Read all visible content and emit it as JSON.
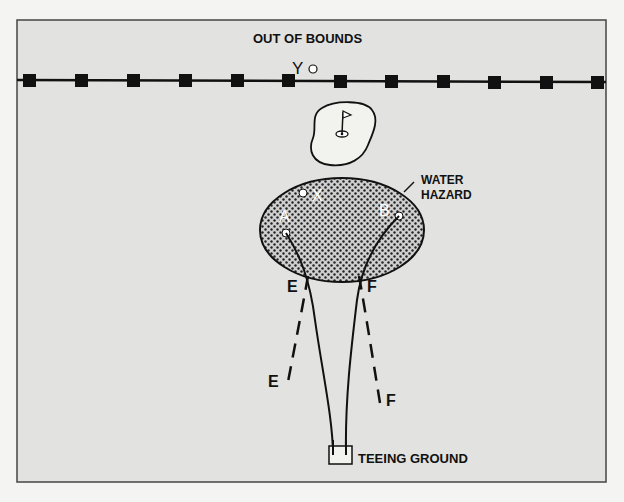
{
  "diagram": {
    "labels": {
      "out_of_bounds": "OUT OF BOUNDS",
      "water_hazard_line1": "WATER",
      "water_hazard_line2": "HAZARD",
      "teeing_ground": "TEEING GROUND"
    },
    "points": {
      "y": "Y",
      "x": "X",
      "a": "A",
      "b": "B",
      "e_upper": "E",
      "f_upper": "F",
      "e_lower": "E",
      "f_lower": "F"
    },
    "colors": {
      "panel_bg": "#e2e2e0",
      "page_bg": "#f4f4f2",
      "line": "#111111",
      "hazard_fill": "#c9c9c9",
      "green_fill": "#f2f2ee"
    },
    "boundary_stakes": 12
  }
}
